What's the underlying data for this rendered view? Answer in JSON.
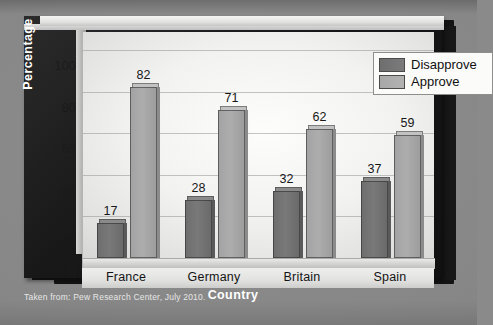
{
  "caption": "Taken from: Pew Research Center, July 2010.",
  "legend": {
    "items": [
      {
        "label": "Disapprove",
        "color": "#707070",
        "swatch_icon": "legend-swatch-icon"
      },
      {
        "label": "Approve",
        "color": "#a8a8a8",
        "swatch_icon": "legend-swatch-icon"
      }
    ]
  },
  "axes": {
    "ylabel": "Percentage",
    "xlabel": "Country",
    "yticks": [
      "0",
      "20",
      "40",
      "60",
      "80",
      "100"
    ]
  },
  "chart_data": {
    "type": "bar",
    "title": "",
    "subtitle": "",
    "xlabel": "Country",
    "ylabel": "Percentage",
    "categories": [
      "France",
      "Germany",
      "Britain",
      "Spain"
    ],
    "series": [
      {
        "name": "Disapprove",
        "values": [
          17,
          28,
          32,
          37
        ],
        "color": "#707070"
      },
      {
        "name": "Approve",
        "values": [
          82,
          71,
          62,
          59
        ],
        "color": "#a8a8a8"
      }
    ],
    "ylim": [
      0,
      100
    ],
    "ytick_step": 20,
    "grid": true,
    "legend_position": "top-right",
    "source_note": "Taken from: Pew Research Center, July 2010."
  }
}
